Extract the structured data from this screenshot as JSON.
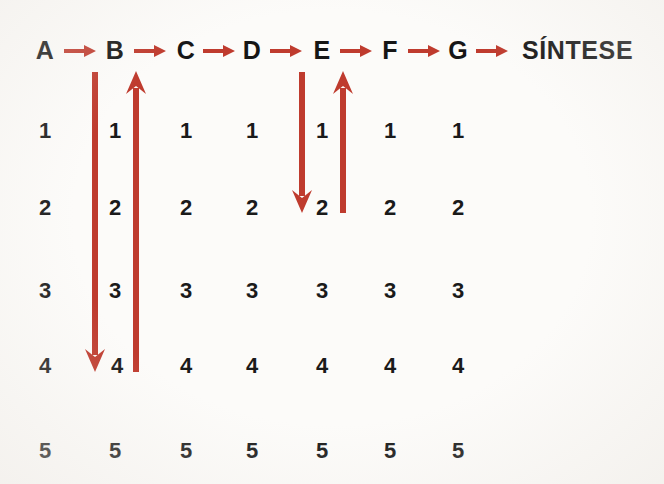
{
  "figure": {
    "background_color": "#fcfbf9",
    "accent_color": "#bf3b2e",
    "text_color": "#1a1a1a"
  },
  "chain": {
    "terminal_label": "SÍNTESE",
    "steps": [
      {
        "label": "A",
        "x": 45
      },
      {
        "label": "B",
        "x": 115
      },
      {
        "label": "C",
        "x": 186
      },
      {
        "label": "D",
        "x": 252
      },
      {
        "label": "E",
        "x": 322
      },
      {
        "label": "F",
        "x": 390
      },
      {
        "label": "G",
        "x": 458
      }
    ],
    "connectors": [
      {
        "name": "a-to-b",
        "x": 64,
        "width": 32
      },
      {
        "name": "b-to-c",
        "x": 134,
        "width": 32
      },
      {
        "name": "c-to-d",
        "x": 203,
        "width": 32
      },
      {
        "name": "d-to-e",
        "x": 270,
        "width": 32
      },
      {
        "name": "e-to-f",
        "x": 340,
        "width": 32
      },
      {
        "name": "f-to-g",
        "x": 408,
        "width": 32
      },
      {
        "name": "g-to-sintese",
        "x": 476,
        "width": 32
      }
    ]
  },
  "grid": {
    "row_labels": [
      "1",
      "2",
      "3",
      "4",
      "5"
    ],
    "row_y": [
      118,
      195,
      278,
      353,
      438
    ],
    "column_x": [
      45,
      115,
      186,
      252,
      322,
      390,
      458
    ],
    "rows": [
      [
        "1",
        "1",
        "1",
        "1",
        "1",
        "1",
        "1"
      ],
      [
        "2",
        "2",
        "2",
        "2",
        "2",
        "2",
        "2"
      ],
      [
        "3",
        "3",
        "3",
        "3",
        "3",
        "3",
        "3"
      ],
      [
        "4",
        "4",
        "4",
        "4",
        "4",
        "4",
        "4"
      ],
      [
        "5",
        "5",
        "5",
        "5",
        "5",
        "5",
        "5"
      ]
    ]
  },
  "review_loops": [
    {
      "name": "loop-a-to-b",
      "down_arrow": {
        "x": 95,
        "from_y": 72,
        "to_y": 368
      },
      "up_arrow": {
        "x": 136,
        "from_y": 368,
        "to_y": 72
      },
      "depth_row": "4"
    },
    {
      "name": "loop-d-to-e",
      "down_arrow": {
        "x": 302,
        "from_y": 72,
        "to_y": 210
      },
      "up_arrow": {
        "x": 343,
        "from_y": 210,
        "to_y": 72
      },
      "depth_row": "2"
    }
  ]
}
